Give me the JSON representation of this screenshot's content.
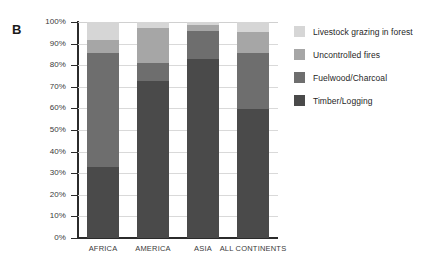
{
  "panel": {
    "letter": "B"
  },
  "chart_data": {
    "type": "bar",
    "subtype": "stacked-percent",
    "title": "",
    "xlabel": "",
    "ylabel": "",
    "ylim": [
      0,
      100
    ],
    "grid": true,
    "legend_position": "right",
    "categories": [
      "AFRICA",
      "AMERICA",
      "ASIA",
      "ALL CONTINENTS"
    ],
    "ytick_labels": [
      "100%",
      "90%",
      "80%",
      "70%",
      "60%",
      "50%",
      "40%",
      "30%",
      "20%",
      "10%",
      "0%"
    ],
    "ytick_values": [
      100,
      90,
      80,
      70,
      60,
      50,
      40,
      30,
      20,
      10,
      0
    ],
    "series": [
      {
        "name": "Livestock grazing in forest",
        "color": "#d6d6d6",
        "values": [
          8.5,
          3.0,
          1.5,
          4.5
        ]
      },
      {
        "name": "Uncontrolled fires",
        "color": "#a6a6a6",
        "values": [
          6.0,
          16.0,
          2.5,
          10.0
        ]
      },
      {
        "name": "Fuelwood/Charcoal",
        "color": "#6e6e6e",
        "values": [
          52.5,
          8.5,
          13.0,
          26.0
        ]
      },
      {
        "name": "Timber/Logging",
        "color": "#4a4a4a",
        "values": [
          33.0,
          72.5,
          83.0,
          59.5
        ]
      }
    ]
  },
  "legend": {
    "items": [
      {
        "label": "Livestock grazing in forest",
        "color": "#d6d6d6"
      },
      {
        "label": "Uncontrolled fires",
        "color": "#a6a6a6"
      },
      {
        "label": "Fuelwood/Charcoal",
        "color": "#6e6e6e"
      },
      {
        "label": "Timber/Logging",
        "color": "#4a4a4a"
      }
    ]
  },
  "colors": {
    "axis": "#2b2b2b",
    "grid": "#d9d9d9",
    "text": "#3a3a3a",
    "background": "#ffffff"
  }
}
